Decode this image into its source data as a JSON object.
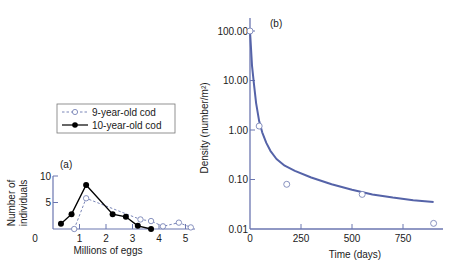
{
  "chart_data": [
    {
      "panel": "(a)",
      "type": "line",
      "title": "",
      "xlabel": "Millions of eggs",
      "ylabel": "Number of individuals",
      "xlim": [
        0,
        5.3
      ],
      "ylim": [
        0,
        10
      ],
      "xticks": [
        0,
        1,
        2,
        3,
        4,
        5
      ],
      "yticks": [
        5,
        10
      ],
      "ytick_labels": [
        "5",
        "10"
      ],
      "x_origin_label": "0",
      "grid": false,
      "legend_position": "upper-left box above plot",
      "series": [
        {
          "name": "9-year-old cod",
          "style": "dashed, open circles",
          "color": "#7a86b8",
          "x": [
            0.8,
            1.25,
            3.3,
            3.7,
            4.15,
            4.75,
            5.2
          ],
          "y": [
            0,
            5.8,
            1.8,
            1.5,
            0.5,
            1.2,
            0.3
          ]
        },
        {
          "name": "10-year-old cod",
          "style": "solid, filled circles",
          "color": "#000000",
          "x": [
            0.3,
            0.7,
            1.25,
            2.25,
            2.75,
            3.2,
            3.7
          ],
          "y": [
            1.0,
            2.8,
            8.3,
            2.8,
            2.3,
            0.6,
            0
          ]
        }
      ]
    },
    {
      "panel": "(b)",
      "type": "line",
      "title": "",
      "xlabel": "Time (days)",
      "ylabel": "Density (number/m²)",
      "yscale": "log",
      "xlim": [
        0,
        950
      ],
      "ylim": [
        0.01,
        100
      ],
      "xticks": [
        0,
        250,
        500,
        750
      ],
      "yticks": [
        0.01,
        0.1,
        1.0,
        10.0,
        100.0
      ],
      "ytick_labels": [
        "0.01",
        "0.10",
        "1.00",
        "10.00",
        "100.00"
      ],
      "grid": false,
      "series": [
        {
          "name": "observed",
          "style": "open circles",
          "color": "#7a86b8",
          "x": [
            0,
            45,
            180,
            550,
            900
          ],
          "y": [
            100,
            1.2,
            0.08,
            0.05,
            0.013
          ]
        },
        {
          "name": "fitted curve",
          "style": "solid line",
          "color": "#5563a8",
          "x": [
            0,
            10,
            20,
            30,
            45,
            60,
            80,
            100,
            130,
            170,
            220,
            300,
            400,
            500,
            600,
            700,
            800,
            900
          ],
          "y": [
            100,
            20,
            8,
            3.5,
            1.5,
            0.9,
            0.55,
            0.38,
            0.26,
            0.19,
            0.15,
            0.11,
            0.08,
            0.062,
            0.05,
            0.043,
            0.038,
            0.035
          ]
        }
      ]
    }
  ],
  "labels": {
    "panel_a": "(a)",
    "panel_b": "(b)",
    "legend_9": "9-year-old cod",
    "legend_10": "10-year-old cod",
    "a_xlabel": "Millions of eggs",
    "a_ylabel_line1": "Number of",
    "a_ylabel_line2": "individuals",
    "b_xlabel": "Time (days)",
    "b_ylabel": "Density (number/m²)"
  },
  "colors": {
    "axis": "#6b76b0",
    "curve": "#5563a8",
    "open_marker": "#7a86b8",
    "filled": "#000000"
  }
}
